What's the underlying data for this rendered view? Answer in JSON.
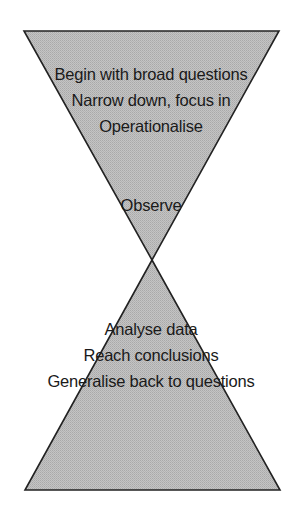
{
  "diagram": {
    "type": "hourglass",
    "colors": {
      "fill": "#bcbcbc",
      "stroke": "#222222",
      "text": "#1a1a1a",
      "background": "#ffffff"
    },
    "top_triangle": {
      "shape": "inverted-triangle",
      "points": "24,31 279,31 152,260",
      "lines": [
        "Begin with broad questions",
        "Narrow down, focus in",
        "Operationalise"
      ],
      "apex_label": "Observe"
    },
    "bottom_triangle": {
      "shape": "triangle",
      "points": "152,260 280,490 25,490",
      "lines": [
        "Analyse data",
        "Reach conclusions",
        "Generalise back to questions"
      ]
    }
  }
}
